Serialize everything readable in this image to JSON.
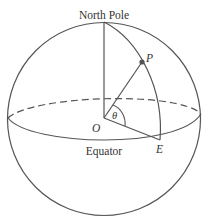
{
  "diagram": {
    "type": "sphere-with-coordinates",
    "labels": {
      "north_pole": "North Pole",
      "point_p": "P",
      "origin": "O",
      "angle": "θ",
      "point_e": "E",
      "equator": "Equator"
    },
    "colors": {
      "stroke": "#555555",
      "text": "#333333",
      "background": "#ffffff"
    }
  }
}
